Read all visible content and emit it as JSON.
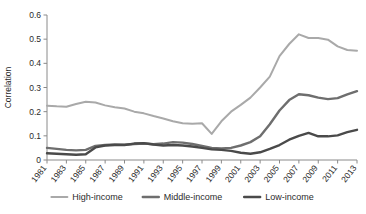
{
  "chart_data": {
    "type": "line",
    "title": "",
    "subtitle": "",
    "xlabel": "",
    "ylabel": "Correlation",
    "xlim": [
      1981,
      2013
    ],
    "ylim": [
      0,
      0.6
    ],
    "grid": false,
    "legend_position": "bottom",
    "x": [
      1981,
      1982,
      1983,
      1984,
      1985,
      1986,
      1987,
      1988,
      1989,
      1990,
      1991,
      1992,
      1993,
      1994,
      1995,
      1996,
      1997,
      1998,
      1999,
      2000,
      2001,
      2002,
      2003,
      2004,
      2005,
      2006,
      2007,
      2008,
      2009,
      2010,
      2011,
      2012,
      2013
    ],
    "xtick_labels": [
      "1981",
      "1983",
      "1985",
      "1987",
      "1989",
      "1991",
      "1993",
      "1995",
      "1997",
      "1999",
      "2001",
      "2003",
      "2005",
      "2007",
      "2009",
      "2011",
      "2013"
    ],
    "xtick_values": [
      1981,
      1983,
      1985,
      1987,
      1989,
      1991,
      1993,
      1995,
      1997,
      1999,
      2001,
      2003,
      2005,
      2007,
      2009,
      2011,
      2013
    ],
    "ytick_labels": [
      "0",
      "0.1",
      "0.2",
      "0.3",
      "0.4",
      "0.5",
      "0.6"
    ],
    "ytick_values": [
      0,
      0.1,
      0.2,
      0.3,
      0.4,
      0.5,
      0.6
    ],
    "series": [
      {
        "name": "High-income",
        "color": "#a9a9a9",
        "width": 2.0,
        "values": [
          0.225,
          0.222,
          0.22,
          0.232,
          0.241,
          0.238,
          0.226,
          0.218,
          0.213,
          0.2,
          0.193,
          0.182,
          0.172,
          0.16,
          0.152,
          0.15,
          0.152,
          0.108,
          0.16,
          0.2,
          0.228,
          0.258,
          0.3,
          0.345,
          0.43,
          0.48,
          0.52,
          0.505,
          0.505,
          0.498,
          0.47,
          0.455,
          0.452
        ]
      },
      {
        "name": "Middle-income",
        "color": "#6e6e6e",
        "width": 2.4,
        "values": [
          0.05,
          0.046,
          0.042,
          0.04,
          0.042,
          0.058,
          0.062,
          0.064,
          0.063,
          0.066,
          0.068,
          0.065,
          0.068,
          0.074,
          0.072,
          0.066,
          0.058,
          0.05,
          0.048,
          0.05,
          0.06,
          0.074,
          0.098,
          0.148,
          0.205,
          0.248,
          0.272,
          0.268,
          0.258,
          0.252,
          0.256,
          0.272,
          0.285
        ]
      },
      {
        "name": "Low-income",
        "color": "#4a4a4a",
        "width": 2.4,
        "values": [
          0.028,
          0.026,
          0.024,
          0.022,
          0.024,
          0.052,
          0.06,
          0.062,
          0.062,
          0.068,
          0.07,
          0.064,
          0.06,
          0.062,
          0.06,
          0.056,
          0.05,
          0.044,
          0.042,
          0.038,
          0.03,
          0.026,
          0.032,
          0.046,
          0.062,
          0.084,
          0.1,
          0.112,
          0.098,
          0.098,
          0.102,
          0.115,
          0.125
        ]
      }
    ]
  },
  "legend": {
    "items": [
      {
        "label": "High-income",
        "color": "#a9a9a9"
      },
      {
        "label": "Middle-income",
        "color": "#6e6e6e"
      },
      {
        "label": "Low-income",
        "color": "#4a4a4a"
      }
    ]
  },
  "axes": {
    "y_title": "Correlation"
  }
}
